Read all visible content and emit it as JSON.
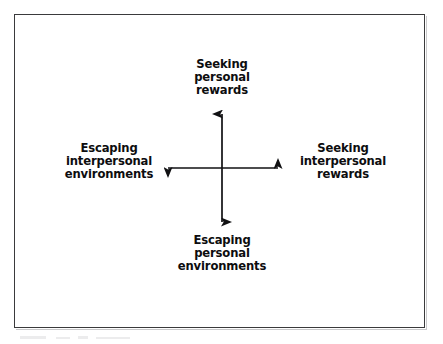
{
  "figure": {
    "background_color": "#ffffff",
    "frame_color": "#3a3a3c",
    "axis_color": "#111113",
    "text_color": "#0d0d0f"
  },
  "axes": {
    "center_x": 222,
    "center_y": 168,
    "vertical": {
      "top_y": 114,
      "bottom_y": 222,
      "arrowheads": "both"
    },
    "horizontal": {
      "left_x": 168,
      "right_x": 278,
      "arrowheads": "both"
    }
  },
  "labels": {
    "top": {
      "name": "seeking-personal-rewards",
      "lines": [
        "Seeking",
        "personal",
        "rewards"
      ]
    },
    "bottom": {
      "name": "escaping-personal-environments",
      "lines": [
        "Escaping",
        "personal",
        "environments"
      ]
    },
    "left": {
      "name": "escaping-interpersonal-environments",
      "lines": [
        "Escaping",
        "interpersonal",
        "environments"
      ]
    },
    "right": {
      "name": "seeking-interpersonal-rewards",
      "lines": [
        "Seeking",
        "interpersonal",
        "rewards"
      ]
    }
  }
}
